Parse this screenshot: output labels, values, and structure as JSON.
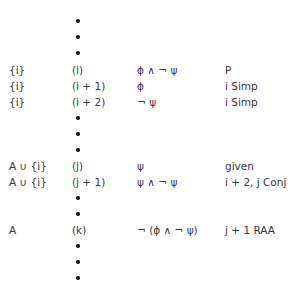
{
  "proof": {
    "dots_top": 3,
    "rows": [
      {
        "assumptions": "{i}",
        "line": "(i)",
        "formula": "ϕ ∧ ¬ ψ",
        "justification": "P"
      },
      {
        "assumptions": "{i}",
        "line": "(i + 1)",
        "formula": "ϕ",
        "justification": "i Simp"
      },
      {
        "assumptions": "{i}",
        "line": "(i + 2)",
        "formula": "¬ ψ",
        "justification": "i Simp"
      },
      {
        "assumptions": "A ∪ {i}",
        "line": "(j)",
        "formula": "ψ",
        "justification": "given"
      },
      {
        "assumptions": "A ∪ {i}",
        "line": "(j + 1)",
        "formula": "ψ ∧ ¬ ψ",
        "justification": "i + 2, j Conj"
      },
      {
        "assumptions": "A",
        "line": "(k)",
        "formula": "¬ (ϕ ∧ ¬ ψ)",
        "justification": "j + 1 RAA"
      }
    ],
    "ellipsis_icon": "vertical-ellipsis-dots"
  }
}
